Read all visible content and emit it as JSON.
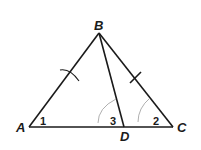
{
  "diagram": {
    "type": "triangle",
    "vertices": {
      "A": {
        "label": "A",
        "x": 29,
        "y": 127
      },
      "B": {
        "label": "B",
        "x": 99,
        "y": 33
      },
      "C": {
        "label": "C",
        "x": 173,
        "y": 127
      },
      "D": {
        "label": "D",
        "x": 124,
        "y": 127
      }
    },
    "segments": [
      "AB",
      "BC",
      "CA",
      "BD"
    ],
    "congruent_marks": {
      "AB": "single arc tick",
      "BC": "single tick"
    },
    "angles": {
      "angle1": {
        "label": "1",
        "vertex": "A"
      },
      "angle2": {
        "label": "2",
        "vertex": "C"
      },
      "angle3": {
        "label": "3",
        "vertex": "D"
      }
    },
    "colors": {
      "line": "#1a1a1a",
      "arc": "#9a9a9a",
      "background": "#ffffff"
    }
  }
}
